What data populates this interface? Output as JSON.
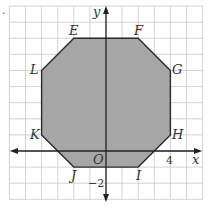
{
  "figure": {
    "grid": {
      "xmin": -6,
      "xmax": 6,
      "ymin": -3,
      "ymax": 9,
      "unit_px": 16.1,
      "origin_px": [
        106,
        151
      ]
    },
    "axes": {
      "x_label": "x",
      "y_label": "y",
      "origin_label": "O",
      "x_tick_label": "4",
      "x_tick_value": 4,
      "y_tick_label": "−2",
      "y_tick_value": -2
    },
    "polygon": {
      "fill": "#a6a6a6",
      "stroke": "#2a2a2a",
      "vertices": [
        {
          "name": "E",
          "x": -2,
          "y": 7
        },
        {
          "name": "F",
          "x": 2,
          "y": 7
        },
        {
          "name": "G",
          "x": 4,
          "y": 5
        },
        {
          "name": "H",
          "x": 4,
          "y": 1
        },
        {
          "name": "I",
          "x": 2,
          "y": -1
        },
        {
          "name": "J",
          "x": -2,
          "y": -1
        },
        {
          "name": "K",
          "x": -4,
          "y": 1
        },
        {
          "name": "L",
          "x": -4,
          "y": 5
        }
      ]
    },
    "labels": {
      "E": "E",
      "F": "F",
      "G": "G",
      "H": "H",
      "I": "I",
      "J": "J",
      "K": "K",
      "L": "L"
    },
    "corner_mark": "."
  }
}
